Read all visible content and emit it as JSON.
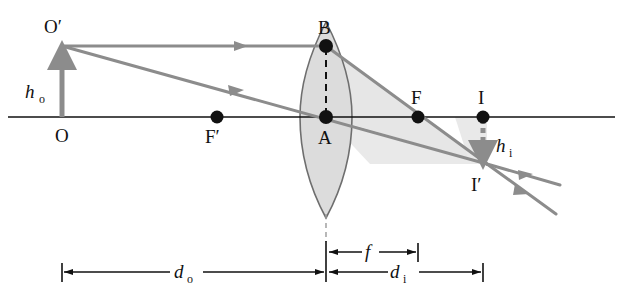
{
  "figure": {
    "type": "ray-diagram",
    "background_color": "#ffffff",
    "ink_color": "#111111",
    "ray_color": "#8c8c8c",
    "lens_fill_color": "#dcdcdc",
    "lens_stroke_color": "#6e6e6e",
    "shade_color": "#e2e2e2"
  },
  "axis": {
    "name": "principal-axis",
    "y": 117,
    "x_start": 8,
    "x_end": 615
  },
  "points": [
    {
      "id": "O",
      "label": "O",
      "x": 62,
      "y": 117,
      "dot": false,
      "label_x": 58,
      "label_y": 140
    },
    {
      "id": "Op",
      "label": "O′",
      "x": 62,
      "y": 46,
      "dot": false,
      "label_x": 44,
      "label_y": 33
    },
    {
      "id": "Fp",
      "label": "F′",
      "x": 217,
      "y": 117,
      "dot": true,
      "label_x": 206,
      "label_y": 141
    },
    {
      "id": "A",
      "label": "A",
      "x": 326,
      "y": 117,
      "dot": true,
      "label_x": 318,
      "label_y": 142
    },
    {
      "id": "B",
      "label": "B",
      "x": 326,
      "y": 46,
      "dot": true,
      "label_x": 318,
      "label_y": 33
    },
    {
      "id": "F",
      "label": "F",
      "x": 418,
      "y": 117,
      "dot": true,
      "label_x": 411,
      "label_y": 102
    },
    {
      "id": "I",
      "label": "I",
      "x": 483,
      "y": 117,
      "dot": true,
      "label_x": 478,
      "label_y": 102
    },
    {
      "id": "Ip",
      "label": "I′",
      "x": 487,
      "y": 164,
      "dot": false,
      "label_x": 473,
      "label_y": 189
    }
  ],
  "heights": [
    {
      "id": "h_o",
      "symbol": "h",
      "subscript": "o",
      "meaning": "object-height",
      "style": "solid-arrow-up",
      "x": 62,
      "y_from": 117,
      "y_to": 46,
      "label_x": 26,
      "label_y": 96
    },
    {
      "id": "h_i",
      "symbol": "h",
      "subscript": "i",
      "meaning": "image-height",
      "style": "dashed-arrow-down",
      "x": 483,
      "y_from": 117,
      "y_to": 164,
      "label_x": 495,
      "label_y": 150
    }
  ],
  "dimensions": [
    {
      "id": "d_o",
      "symbol": "d",
      "subscript": "o",
      "meaning": "object-distance",
      "y": 272,
      "x_from": 62,
      "x_to": 326,
      "label_x": 184,
      "label_y": 268
    },
    {
      "id": "f",
      "symbol": "f",
      "subscript": "",
      "meaning": "focal-length",
      "y": 252,
      "x_from": 327,
      "x_to": 418,
      "label_x": 369,
      "label_y": 248
    },
    {
      "id": "d_i",
      "symbol": "d",
      "subscript": "i",
      "meaning": "image-distance",
      "y": 272,
      "x_from": 327,
      "x_to": 483,
      "label_x": 399,
      "label_y": 268
    }
  ],
  "lens": {
    "name": "converging-lens",
    "center_x": 326,
    "top_y": 22,
    "bottom_y": 218,
    "half_width": 25
  },
  "rays": [
    {
      "id": "parallel-ray",
      "description": "from O' parallel to axis to B, then refracted through F to I' and beyond",
      "segments": [
        {
          "from": [
            62,
            46
          ],
          "to": [
            326,
            46
          ]
        },
        {
          "from": [
            326,
            46
          ],
          "to": [
            487,
            164
          ]
        },
        {
          "from": [
            487,
            164
          ],
          "to": [
            556,
            214
          ]
        }
      ],
      "arrow_marks": [
        {
          "x": 242,
          "y": 46,
          "dir": "right"
        },
        {
          "x": 412,
          "y": 109,
          "dir": "down-right"
        },
        {
          "x": 525,
          "y": 192,
          "dir": "down-right"
        }
      ]
    },
    {
      "id": "center-ray",
      "description": "from O' straight through lens center A to I' and beyond",
      "segments": [
        {
          "from": [
            62,
            46
          ],
          "to": [
            487,
            164
          ]
        },
        {
          "from": [
            487,
            164
          ],
          "to": [
            558,
            184
          ]
        }
      ],
      "arrow_marks": [
        {
          "x": 236,
          "y": 94,
          "dir": "down-right"
        },
        {
          "x": 400,
          "y": 140,
          "dir": "down-right"
        },
        {
          "x": 530,
          "y": 176,
          "dir": "down-right"
        }
      ]
    }
  ],
  "shaded_regions": [
    {
      "id": "shade-upper-triangle",
      "points": "326,46 487,164 326,117"
    },
    {
      "id": "shade-lower-triangle",
      "points": "326,117 487,164 360,164"
    }
  ]
}
